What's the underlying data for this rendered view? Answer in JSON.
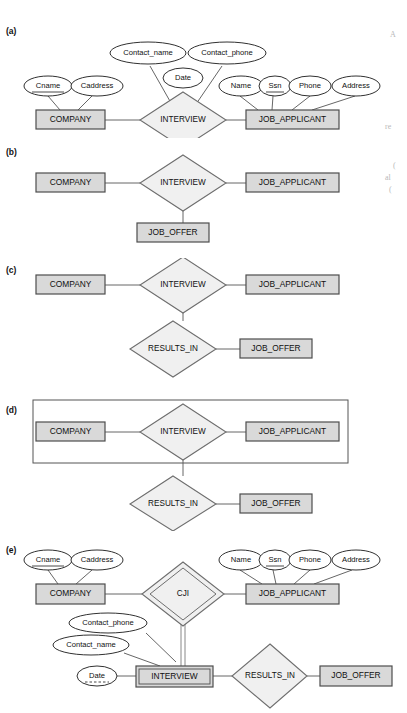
{
  "figure": {
    "background": "#ffffff",
    "colors": {
      "entity_fill": "#d9d9d9",
      "entity_stroke": "#4d4d4d",
      "relationship_fill": "#f0f0f0",
      "relationship_stroke": "#6e6e6e",
      "attribute_fill": "#ffffff",
      "attribute_stroke": "#1a1a1a",
      "line": "#555555",
      "text": "#101010",
      "margin_text": "#b9b9b9"
    }
  },
  "section_labels": {
    "a": "(a)",
    "b": "(b)",
    "c": "(c)",
    "d": "(d)",
    "e": "(e)"
  },
  "margin_fragments": [
    {
      "text": "A",
      "x": 390,
      "y": 34
    },
    {
      "text": "re",
      "x": 385,
      "y": 126
    },
    {
      "text": "(",
      "x": 392,
      "y": 165
    },
    {
      "text": "al",
      "x": 385,
      "y": 178
    },
    {
      "text": "(",
      "x": 388,
      "y": 190
    }
  ],
  "entities": {
    "company": "COMPANY",
    "job_applicant": "JOB_APPLICANT",
    "job_offer": "JOB_OFFER",
    "interview": "INTERVIEW"
  },
  "relationships": {
    "interview": "INTERVIEW",
    "results_in": "RESULTS_IN",
    "cji": "CJI"
  },
  "attributes": {
    "cname": "Cname",
    "caddress": "Caddress",
    "contact_name": "Contact_name",
    "contact_phone": "Contact_phone",
    "date": "Date",
    "name": "Name",
    "ssn": "Ssn",
    "phone": "Phone",
    "address": "Address"
  },
  "diagram_a": {
    "label": "(a)",
    "description": "INTERVIEW as a relationship with attributes, between COMPANY and JOB_APPLICANT",
    "entities": [
      "COMPANY",
      "JOB_APPLICANT"
    ],
    "relationship": "INTERVIEW",
    "relationship_attributes": [
      "Contact_name",
      "Contact_phone",
      "Date"
    ],
    "company_attributes": [
      "Cname",
      "Caddress"
    ],
    "company_key": "Cname",
    "applicant_attributes": [
      "Name",
      "Ssn",
      "Phone",
      "Address"
    ],
    "applicant_key": "Ssn"
  },
  "diagram_b": {
    "label": "(b)",
    "description": "Ternary relationship INTERVIEW among COMPANY, JOB_APPLICANT and JOB_OFFER",
    "entities": [
      "COMPANY",
      "JOB_APPLICANT",
      "JOB_OFFER"
    ],
    "relationship": "INTERVIEW"
  },
  "diagram_c": {
    "label": "(c)",
    "description": "INTERVIEW relationship plus RESULTS_IN relationship to JOB_OFFER",
    "entities": [
      "COMPANY",
      "JOB_APPLICANT",
      "JOB_OFFER"
    ],
    "relationships": [
      "INTERVIEW",
      "RESULTS_IN"
    ]
  },
  "diagram_d": {
    "label": "(d)",
    "description": "INTERVIEW relationship treated as an aggregation (outer rectangle) related by RESULTS_IN to JOB_OFFER",
    "entities": [
      "COMPANY",
      "JOB_APPLICANT",
      "JOB_OFFER"
    ],
    "relationships": [
      "INTERVIEW",
      "RESULTS_IN"
    ],
    "aggregation_box_contains": [
      "COMPANY",
      "INTERVIEW",
      "JOB_APPLICANT"
    ]
  },
  "diagram_e": {
    "label": "(e)",
    "description": "INTERVIEW as a weak entity identified by the CJI identifying relationship with COMPANY and JOB_APPLICANT",
    "entities": [
      "COMPANY",
      "JOB_APPLICANT",
      "JOB_OFFER"
    ],
    "weak_entity": "INTERVIEW",
    "identifying_relationship": "CJI",
    "relationships": [
      "CJI",
      "RESULTS_IN"
    ],
    "company_attributes": [
      "Cname",
      "Caddress"
    ],
    "company_key": "Cname",
    "applicant_attributes": [
      "Name",
      "Ssn",
      "Phone",
      "Address"
    ],
    "applicant_key": "Ssn",
    "interview_attributes": [
      "Contact_phone",
      "Contact_name",
      "Date"
    ],
    "interview_partial_key": "Date"
  }
}
